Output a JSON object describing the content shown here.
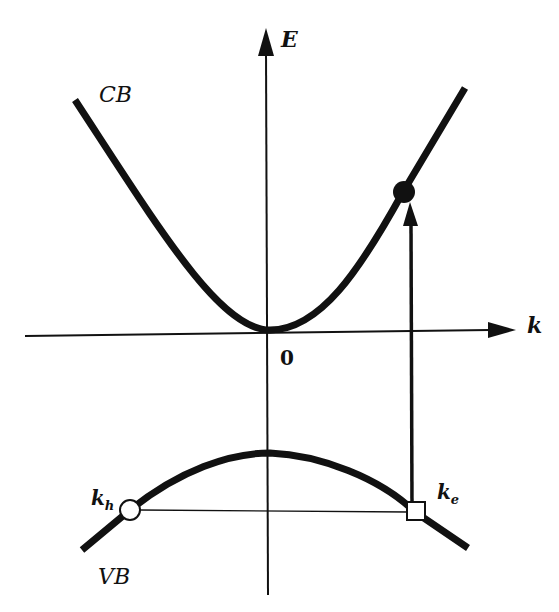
{
  "diagram": {
    "type": "band-structure",
    "axes": {
      "vertical_label": "E",
      "horizontal_label": "k",
      "origin_label": "0"
    },
    "bands": {
      "conduction": {
        "label": "CB",
        "shape": "upward parabola",
        "minimum_at": "k=0"
      },
      "valence": {
        "label": "VB",
        "shape": "downward parabola",
        "maximum_at": "k=0"
      }
    },
    "markers": {
      "electron": {
        "label": "filled circle on CB",
        "style": "filled"
      },
      "hole": {
        "label_main": "k",
        "label_sub": "h",
        "style": "open-circle"
      },
      "electron_origin": {
        "label_main": "k",
        "label_sub": "e",
        "style": "open-square"
      }
    },
    "transition": {
      "description": "vertical arrow from open square on VB to filled circle on CB"
    },
    "connector": {
      "description": "thin horizontal line between k_h and k_e at equal energy"
    },
    "colors": {
      "line": "#111111",
      "background": "#ffffff"
    }
  }
}
